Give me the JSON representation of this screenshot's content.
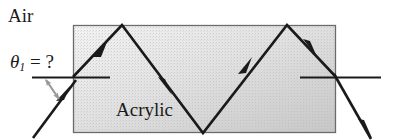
{
  "figure": {
    "title_labels": {
      "air": "Air",
      "acrylic": "Acrylic",
      "theta_symbol": "θ",
      "theta_subscript": "1",
      "theta_equals": " = ?"
    },
    "colors": {
      "block_fill_light": "#f2f2f2",
      "block_fill_dark": "#c9c9c9",
      "block_border": "#6b6b6b",
      "ray": "#1a1a1a",
      "normal_line": "#1a1a1a",
      "angle_arrow": "#9a9a9a",
      "text": "#1a1a1a",
      "background": "#ffffff"
    },
    "block": {
      "name": "acrylic-slab",
      "x": 73,
      "y": 25,
      "width": 263,
      "height": 108
    },
    "normals": [
      {
        "name": "left-normal",
        "x1": 32,
        "y1": 77,
        "x2": 110,
        "y2": 77
      },
      {
        "name": "right-normal",
        "x1": 300,
        "y1": 77,
        "x2": 381,
        "y2": 77
      }
    ],
    "rays": {
      "incident": {
        "name": "incident-ray",
        "points": [
          [
            33,
            138
          ],
          [
            73,
            77
          ]
        ],
        "arrow_at": [
          62,
          94
        ]
      },
      "internal": {
        "name": "internal-ray-path",
        "points": [
          [
            73,
            77
          ],
          [
            122,
            25
          ],
          [
            203,
            133
          ],
          [
            287,
            25
          ],
          [
            336,
            77
          ]
        ],
        "arrows_at": [
          [
            100,
            48
          ],
          [
            165,
            85
          ],
          [
            245,
            83
          ],
          [
            310,
            47
          ]
        ]
      },
      "exit": {
        "name": "exit-ray",
        "points": [
          [
            336,
            77
          ],
          [
            370,
            138
          ]
        ],
        "arrow_at": [
          366,
          131
        ]
      }
    },
    "angle_marker": {
      "name": "theta1-angle-arrow",
      "vertex": [
        73,
        77
      ],
      "from": [
        45,
        79
      ],
      "to": [
        58,
        100
      ],
      "double_headed": true
    }
  }
}
